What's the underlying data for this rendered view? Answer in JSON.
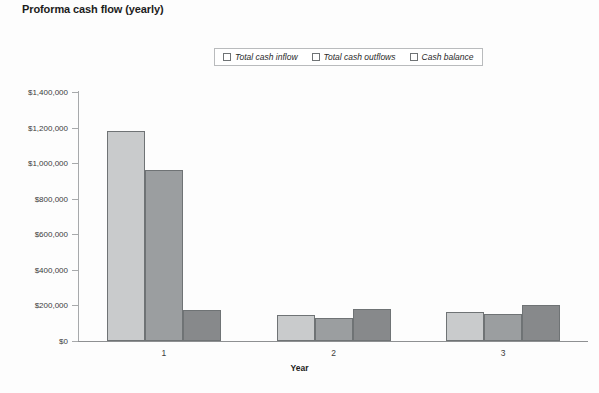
{
  "chart_data": {
    "type": "bar",
    "title": "Proforma cash flow (yearly)",
    "xlabel": "Year",
    "ylabel": "",
    "categories": [
      "1",
      "2",
      "3"
    ],
    "series": [
      {
        "name": "Total cash inflow",
        "values": [
          1180000,
          145000,
          165000
        ],
        "color": "#c9cbcc"
      },
      {
        "name": "Total cash outflows",
        "values": [
          960000,
          132000,
          150000
        ],
        "color": "#9b9ea0"
      },
      {
        "name": "Cash balance",
        "values": [
          175000,
          182000,
          200000
        ],
        "color": "#87898b"
      }
    ],
    "ylim": [
      0,
      1400000
    ],
    "yticks": [
      0,
      200000,
      400000,
      600000,
      800000,
      1000000,
      1200000,
      1400000
    ],
    "ytick_labels": [
      "$0",
      "$200,000",
      "$400,000",
      "$600,000",
      "$800,000",
      "$1,000,000",
      "$1,200,000",
      "$1,400,000"
    ],
    "grid": false,
    "legend_position": "top-center"
  },
  "legend": {
    "items": [
      {
        "label": "Total cash inflow"
      },
      {
        "label": "Total cash outflows"
      },
      {
        "label": "Cash balance"
      }
    ]
  }
}
